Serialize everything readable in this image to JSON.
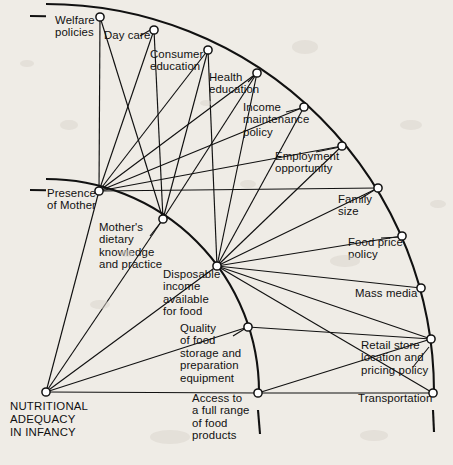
{
  "diagram": {
    "background_color": "#efece6",
    "line_color": "#111111",
    "node_fill": "#ffffff",
    "hub": {
      "id": "hub",
      "label": "NUTRITIONAL\nADEQUACY\nIN INFANCY",
      "x": 46,
      "y": 392
    },
    "rings": [
      {
        "name": "inner-ring",
        "radius": 213
      },
      {
        "name": "outer-ring",
        "radius": 388
      }
    ],
    "nodes": [
      {
        "id": "welfare",
        "label": "Welfare\npolicies",
        "x": 100,
        "y": 17,
        "ring": "outer",
        "label_x": 55,
        "label_y": 14,
        "align": "left"
      },
      {
        "id": "daycare",
        "label": "Day care",
        "x": 154,
        "y": 30,
        "ring": "outer",
        "label_x": 104,
        "label_y": 29,
        "align": "left"
      },
      {
        "id": "consumer",
        "label": "Consumer\neducation",
        "x": 208,
        "y": 50,
        "ring": "outer",
        "label_x": 150,
        "label_y": 48,
        "align": "left"
      },
      {
        "id": "health",
        "label": "Health\neducation",
        "x": 257,
        "y": 73,
        "ring": "outer",
        "label_x": 209,
        "label_y": 71,
        "align": "left"
      },
      {
        "id": "income_maint",
        "label": "Income\nmaintenance\npolicy",
        "x": 304,
        "y": 107,
        "ring": "outer",
        "label_x": 243,
        "label_y": 101,
        "align": "left"
      },
      {
        "id": "employment",
        "label": "Employment\nopportunity",
        "x": 342,
        "y": 146,
        "ring": "outer",
        "label_x": 275,
        "label_y": 150,
        "align": "left"
      },
      {
        "id": "family_size",
        "label": "Family\nsize",
        "x": 378,
        "y": 188,
        "ring": "outer",
        "label_x": 338,
        "label_y": 193,
        "align": "left"
      },
      {
        "id": "food_price",
        "label": "Food price\npolicy",
        "x": 402,
        "y": 236,
        "ring": "outer",
        "label_x": 348,
        "label_y": 236,
        "align": "left"
      },
      {
        "id": "mass_media",
        "label": "Mass media",
        "x": 421,
        "y": 288,
        "ring": "outer",
        "label_x": 355,
        "label_y": 287,
        "align": "left"
      },
      {
        "id": "retail_store",
        "label": "Retail store\nlocation and\npricing policy",
        "x": 431,
        "y": 339,
        "ring": "outer",
        "label_x": 361,
        "label_y": 339,
        "align": "left"
      },
      {
        "id": "transportation",
        "label": "Transportation",
        "x": 433,
        "y": 393,
        "ring": "outer",
        "label_x": 358,
        "label_y": 392,
        "align": "left"
      },
      {
        "id": "presence",
        "label": "Presence\nof Mother",
        "x": 99,
        "y": 191,
        "ring": "inner",
        "label_x": 47,
        "label_y": 187,
        "align": "left"
      },
      {
        "id": "mothers_diet",
        "label": "Mother's\ndietary\nknowledge\nand practice",
        "x": 163,
        "y": 219,
        "ring": "inner",
        "label_x": 99,
        "label_y": 221,
        "align": "left"
      },
      {
        "id": "disposable",
        "label": "Disposable\nincome\navailable\nfor food",
        "x": 217,
        "y": 266,
        "ring": "inner",
        "label_x": 163,
        "label_y": 268,
        "align": "left"
      },
      {
        "id": "quality_food",
        "label": "Quality\nof food\nstorage and\npreparation\nequipment",
        "x": 248,
        "y": 327,
        "ring": "inner",
        "label_x": 180,
        "label_y": 322,
        "align": "left"
      },
      {
        "id": "access_food",
        "label": "Access to\na full range\nof food\nproducts",
        "x": 258,
        "y": 393,
        "ring": "inner",
        "label_x": 192,
        "label_y": 392,
        "align": "left"
      }
    ],
    "edges": [
      {
        "from": "hub",
        "to": "presence"
      },
      {
        "from": "hub",
        "to": "mothers_diet"
      },
      {
        "from": "hub",
        "to": "disposable"
      },
      {
        "from": "hub",
        "to": "quality_food"
      },
      {
        "from": "hub",
        "to": "access_food"
      },
      {
        "from": "presence",
        "to": "welfare"
      },
      {
        "from": "presence",
        "to": "daycare"
      },
      {
        "from": "presence",
        "to": "consumer"
      },
      {
        "from": "presence",
        "to": "health"
      },
      {
        "from": "presence",
        "to": "income_maint"
      },
      {
        "from": "presence",
        "to": "employment"
      },
      {
        "from": "presence",
        "to": "family_size"
      },
      {
        "from": "mothers_diet",
        "to": "welfare"
      },
      {
        "from": "mothers_diet",
        "to": "daycare"
      },
      {
        "from": "mothers_diet",
        "to": "consumer"
      },
      {
        "from": "mothers_diet",
        "to": "health"
      },
      {
        "from": "disposable",
        "to": "consumer"
      },
      {
        "from": "disposable",
        "to": "health"
      },
      {
        "from": "disposable",
        "to": "income_maint"
      },
      {
        "from": "disposable",
        "to": "employment"
      },
      {
        "from": "disposable",
        "to": "family_size"
      },
      {
        "from": "disposable",
        "to": "food_price"
      },
      {
        "from": "disposable",
        "to": "mass_media"
      },
      {
        "from": "disposable",
        "to": "retail_store"
      },
      {
        "from": "disposable",
        "to": "transportation"
      },
      {
        "from": "quality_food",
        "to": "retail_store"
      },
      {
        "from": "access_food",
        "to": "retail_store"
      },
      {
        "from": "access_food",
        "to": "transportation"
      }
    ],
    "leaders": [
      {
        "from_x": 152,
        "from_y": 29,
        "to_x": 140,
        "to_y": 36,
        "note": "day-care-leader"
      },
      {
        "from_x": 256,
        "from_y": 74,
        "to_x": 248,
        "to_y": 82,
        "note": "health-education-leader"
      },
      {
        "from_x": 302,
        "from_y": 108,
        "to_x": 286,
        "to_y": 112,
        "note": "income-maintenance-leader"
      },
      {
        "from_x": 340,
        "from_y": 147,
        "to_x": 316,
        "to_y": 152,
        "note": "employment-leader"
      },
      {
        "from_x": 376,
        "from_y": 189,
        "to_x": 360,
        "to_y": 199,
        "note": "family-size-leader"
      },
      {
        "from_x": 400,
        "from_y": 237,
        "to_x": 381,
        "to_y": 238,
        "note": "food-price-leader"
      },
      {
        "from_x": 429,
        "from_y": 347,
        "to_x": 413,
        "to_y": 367,
        "note": "retail-store-leader"
      },
      {
        "from_x": 246,
        "from_y": 328,
        "to_x": 233,
        "to_y": 336,
        "note": "quality-food-leader"
      },
      {
        "from_x": 161,
        "from_y": 222,
        "to_x": 150,
        "to_y": 236,
        "note": "mothers-diet-leader"
      }
    ]
  }
}
